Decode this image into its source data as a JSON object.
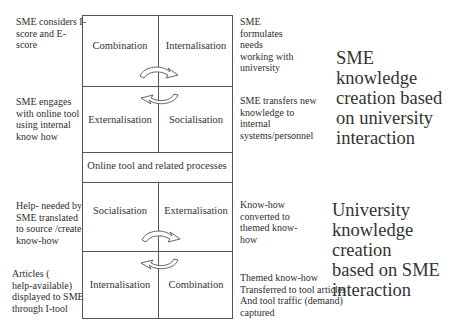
{
  "upper_quadrant": {
    "top_left": "Combination",
    "top_right": "Internalisation",
    "bottom_left": "Externalisation",
    "bottom_right": "Socialisation"
  },
  "middle_band": {
    "label": "Online tool and related processes"
  },
  "lower_quadrant": {
    "top_left": "Socialisation",
    "top_right": "Externalisation",
    "bottom_left": "Internalisation",
    "bottom_right": "Combination"
  },
  "left_notes": [
    [
      "SME considers I-",
      "score and E-",
      "score"
    ],
    [
      "SME engages",
      "with online tool",
      "using internal",
      "know how"
    ],
    [
      "Help- needed by",
      "SME translated",
      "to source /create",
      "know-how"
    ],
    [
      "Articles (",
      "help-available)",
      "displayed to SME",
      "through I-tool"
    ]
  ],
  "right_notes": [
    [
      "SME",
      "formulates",
      "needs",
      "working with",
      "university"
    ],
    [
      "SME transfers new",
      "knowledge to",
      "internal",
      "systems/personnel"
    ],
    [
      "Know-how",
      "converted to",
      "themed know-",
      "how"
    ],
    [
      "Themed know-how",
      "Transferred to tool articles",
      "And tool traffic (demand)",
      "captured"
    ]
  ],
  "headings": {
    "upper": [
      "SME",
      "knowledge",
      "creation based",
      "on university",
      "interaction"
    ],
    "lower": [
      "University",
      "knowledge creation",
      "based on SME",
      "interaction"
    ]
  },
  "arrows": {
    "upper_cycle": [
      "curved-arrow-right",
      "curved-arrow-left"
    ],
    "lower_cycle": [
      "curved-arrow-right",
      "curved-arrow-left"
    ]
  }
}
